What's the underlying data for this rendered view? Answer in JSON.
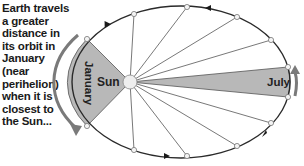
{
  "caption": "Earth travels a greater distance in its orbit in January (near perihelion) when it is closest to the Sun...",
  "labels": {
    "sun": "Sun",
    "january": "January",
    "july": "July"
  },
  "colors": {
    "orbit": "#2a2a2a",
    "spoke": "#555555",
    "wedge_fill": "#b8b8b8",
    "arrow": "#7a7a7a",
    "sun_fill": "#eeeeee"
  },
  "orbit": {
    "center": [
      181,
      82
    ],
    "rx": 109,
    "ry": 76,
    "direction": "counter-clockwise",
    "points": [
      [
        87,
        39
      ],
      [
        134,
        14
      ],
      [
        187,
        7
      ],
      [
        237,
        17
      ],
      [
        271,
        40
      ],
      [
        288,
        67
      ],
      [
        288,
        97
      ],
      [
        271,
        123
      ],
      [
        237,
        146
      ],
      [
        187,
        156
      ],
      [
        134,
        150
      ],
      [
        87,
        126
      ]
    ]
  },
  "sun": {
    "x": 130,
    "y": 82,
    "r": 7
  },
  "wedges": [
    {
      "name": "january",
      "from": [
        87,
        39
      ],
      "to": [
        87,
        126
      ]
    },
    {
      "name": "july",
      "from": [
        288,
        67
      ],
      "to": [
        288,
        97
      ]
    }
  ]
}
